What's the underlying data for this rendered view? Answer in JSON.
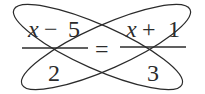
{
  "equation": {
    "left": {
      "numerator": {
        "variable": "x",
        "operator": "−",
        "constant": "5"
      },
      "denominator": "2"
    },
    "relation": "=",
    "right": {
      "numerator": {
        "variable": "x",
        "operator": "+",
        "constant": "1"
      },
      "denominator": "3"
    }
  },
  "annotations": {
    "ellipse_1": "links left numerator (x − 5) with right denominator (3)",
    "ellipse_2": "links right numerator (x + 1) with left denominator (2)",
    "meaning": "cross-multiplication"
  },
  "colors": {
    "ink": "#2b2b2b",
    "background": "#ffffff"
  }
}
